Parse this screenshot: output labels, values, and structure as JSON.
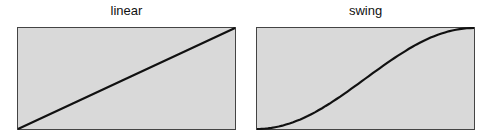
{
  "panels": [
    {
      "title": "linear",
      "curve": "linear",
      "points": [
        [
          0,
          0
        ],
        [
          0.25,
          0.25
        ],
        [
          0.5,
          0.5
        ],
        [
          0.75,
          0.75
        ],
        [
          1,
          1
        ]
      ]
    },
    {
      "title": "swing",
      "curve": "swing",
      "points": [
        [
          0,
          0
        ],
        [
          0.1,
          0.024
        ],
        [
          0.2,
          0.095
        ],
        [
          0.3,
          0.206
        ],
        [
          0.4,
          0.345
        ],
        [
          0.5,
          0.5
        ],
        [
          0.6,
          0.655
        ],
        [
          0.7,
          0.794
        ],
        [
          0.8,
          0.905
        ],
        [
          0.9,
          0.976
        ],
        [
          1,
          1
        ]
      ]
    }
  ],
  "colors": {
    "plot_fill": "#d9d9d9",
    "plot_border": "#444444",
    "curve": "#111111"
  }
}
